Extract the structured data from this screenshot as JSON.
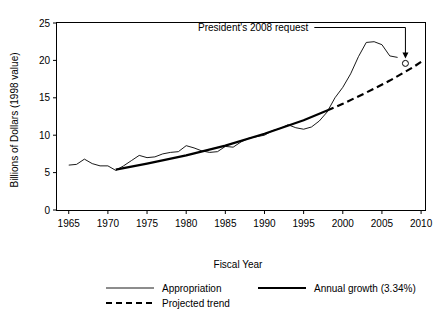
{
  "chart_data": {
    "type": "line",
    "title": "",
    "xlabel": "Fiscal Year",
    "ylabel": "Billions of Dollars (1998 value)",
    "xlim": [
      1963.5,
      2010.5
    ],
    "ylim": [
      0,
      25
    ],
    "xticks": [
      1965,
      1970,
      1975,
      1980,
      1985,
      1990,
      1995,
      2000,
      2005,
      2010
    ],
    "yticks": [
      0,
      5,
      10,
      15,
      20,
      25
    ],
    "xtick_labels": [
      "1965",
      "1970",
      "1975",
      "1980",
      "1985",
      "1990",
      "1995",
      "2000",
      "2005",
      "2010"
    ],
    "ytick_labels": [
      "0",
      "5",
      "10",
      "15",
      "20",
      "25"
    ],
    "grid": false,
    "legend_position": "below-plot",
    "series": [
      {
        "name": "Appropriation",
        "style": "thin-solid",
        "color": "#000000",
        "x": [
          1965,
          1966,
          1967,
          1968,
          1969,
          1970,
          1971,
          1972,
          1973,
          1974,
          1975,
          1976,
          1977,
          1978,
          1979,
          1980,
          1981,
          1982,
          1983,
          1984,
          1985,
          1986,
          1987,
          1988,
          1989,
          1990,
          1991,
          1992,
          1993,
          1994,
          1995,
          1996,
          1997,
          1998,
          1999,
          2000,
          2001,
          2002,
          2003,
          2004,
          2005,
          2006,
          2007
        ],
        "values": [
          6.0,
          6.1,
          6.8,
          6.2,
          5.9,
          5.9,
          5.3,
          5.9,
          6.6,
          7.3,
          7.0,
          7.1,
          7.5,
          7.7,
          7.8,
          8.6,
          8.3,
          7.9,
          7.7,
          7.8,
          8.5,
          8.4,
          9.1,
          9.6,
          9.8,
          10.0,
          10.6,
          10.9,
          11.4,
          11.0,
          10.8,
          11.1,
          11.9,
          13.1,
          15.0,
          16.4,
          18.2,
          20.5,
          22.4,
          22.5,
          22.1,
          20.6,
          20.4
        ]
      },
      {
        "name": "Annual growth (3.34%)",
        "style": "thick-solid",
        "color": "#000000",
        "x": [
          1971,
          1975,
          1980,
          1985,
          1990,
          1995,
          1998
        ],
        "values": [
          5.4,
          6.2,
          7.3,
          8.6,
          10.2,
          12.0,
          13.3
        ]
      },
      {
        "name": "Projected trend",
        "style": "thick-dashed",
        "color": "#000000",
        "x": [
          1998,
          2000,
          2003,
          2006,
          2009,
          2010
        ],
        "values": [
          13.3,
          14.2,
          15.7,
          17.3,
          19.1,
          19.8
        ]
      }
    ],
    "annotations": [
      {
        "name": "presidents-request-callout",
        "text": "President's 2008 request",
        "target_x": 2008,
        "target_y": 19.6,
        "marker": "open-circle"
      }
    ]
  },
  "legend": {
    "entries": [
      {
        "label": "Appropriation",
        "style": "thin-solid"
      },
      {
        "label": "Projected trend",
        "style": "thick-dashed"
      },
      {
        "label": "Annual growth (3.34%)",
        "style": "thick-solid"
      }
    ]
  }
}
